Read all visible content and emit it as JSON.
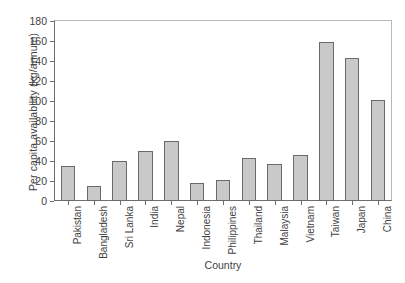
{
  "chart_data": {
    "type": "bar",
    "title": "",
    "xlabel": "Country",
    "ylabel": "Per capita availability (kg/annum)",
    "categories": [
      "Pakistan",
      "Bangladesh",
      "Sri Lanka",
      "India",
      "Nepal",
      "Indonesia",
      "Philippines",
      "Thailand",
      "Malaysia",
      "Vietnam",
      "Taiwan",
      "Japan",
      "China"
    ],
    "values": [
      35,
      15,
      40,
      50,
      60,
      18,
      21,
      43,
      37,
      46,
      159,
      143,
      101
    ],
    "ylim": [
      0,
      180
    ],
    "ytick_step": 20,
    "yticks": [
      0,
      20,
      40,
      60,
      80,
      100,
      120,
      140,
      160,
      180
    ],
    "ytick_labels": [
      "0",
      "20",
      "40",
      "60",
      "80",
      "100",
      "120",
      "140",
      "160",
      "180"
    ],
    "grid": false,
    "legend": false,
    "bar_fill_color": "#c9c9c9",
    "bar_border_color": "#6a6a6a",
    "axis_color": "#6e6e6e"
  }
}
